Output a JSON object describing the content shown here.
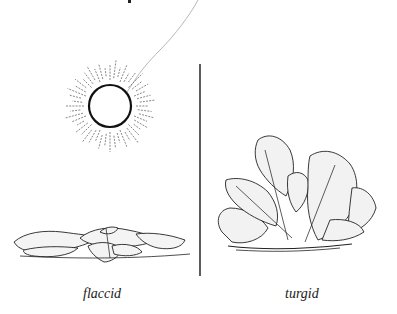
{
  "figure": {
    "labels": {
      "left": "flaccid",
      "right": "turgid"
    },
    "elements": {
      "sun": "sun-icon",
      "left_plant": "wilted-plant",
      "right_plant": "upright-plant",
      "divider": "vertical-divider"
    },
    "colors": {
      "ink": "#1a1a1a",
      "ray_line": "#b0b0b0",
      "background": "#ffffff"
    }
  }
}
